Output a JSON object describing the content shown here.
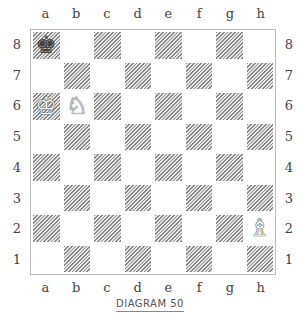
{
  "diagram": {
    "caption": "DIAGRAM 50",
    "files": [
      "a",
      "b",
      "c",
      "d",
      "e",
      "f",
      "g",
      "h"
    ],
    "ranks": [
      "8",
      "7",
      "6",
      "5",
      "4",
      "3",
      "2",
      "1"
    ],
    "pieces": [
      {
        "square": "a8",
        "color": "black",
        "type": "king",
        "glyph": "♚"
      },
      {
        "square": "a6",
        "color": "white",
        "type": "king",
        "glyph": "♔"
      },
      {
        "square": "b6",
        "color": "white",
        "type": "knight",
        "glyph": "♘"
      },
      {
        "square": "h2",
        "color": "white",
        "type": "bishop",
        "glyph": "♗"
      }
    ],
    "colors": {
      "dark_hatch": "#8a8a8a",
      "border": "#bbbbbb",
      "label": "#444444"
    }
  }
}
